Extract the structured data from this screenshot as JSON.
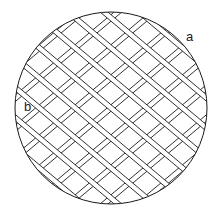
{
  "figure": {
    "labels": {
      "a": "a",
      "b": "b"
    },
    "circle": {
      "cx": 111,
      "cy": 108,
      "r": 96
    },
    "colors": {
      "stroke": "#1a1a1a",
      "background": "#ffffff"
    },
    "bands": {
      "band_width": 5,
      "down_right": {
        "angle_deg": 40,
        "offsets": [
          -92,
          -69,
          -46,
          -23,
          0,
          23,
          46,
          69,
          92
        ]
      },
      "up_right": {
        "angle_deg": -40,
        "offsets": [
          -92,
          -69,
          -46,
          -23,
          0,
          23,
          46,
          69,
          92
        ]
      }
    }
  }
}
